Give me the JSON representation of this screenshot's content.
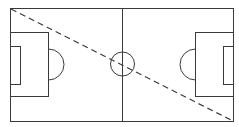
{
  "diagram": {
    "type": "soccer-field",
    "background": "#ffffff",
    "line_color": "#3a3a3a",
    "field": {
      "x": 10,
      "y": 8,
      "width": 223,
      "height": 113
    },
    "center_line_x": 122,
    "center_circle": {
      "cx": 122,
      "cy": 64,
      "r": 12
    },
    "left_penalty_box": {
      "x": 10,
      "y": 32,
      "width": 38,
      "height": 64
    },
    "left_goal_box": {
      "x": 10,
      "y": 46,
      "width": 10,
      "height": 38
    },
    "right_penalty_box": {
      "x": 195,
      "y": 32,
      "width": 38,
      "height": 64
    },
    "right_goal_box": {
      "x": 223,
      "y": 46,
      "width": 10,
      "height": 38
    },
    "diagonal_dashed_line": {
      "x1": 10,
      "y1": 8,
      "x2": 233,
      "y2": 121
    }
  }
}
